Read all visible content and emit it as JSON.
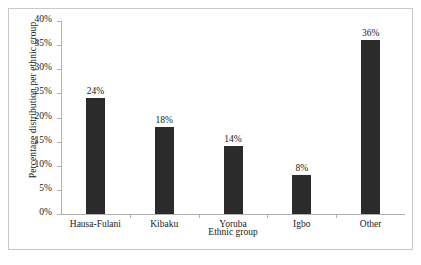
{
  "chart_data": {
    "type": "bar",
    "title": "",
    "categories": [
      "Hausa-Fulani",
      "Kibaku",
      "Yoruba",
      "Igbo",
      "Other"
    ],
    "values": [
      24,
      18,
      14,
      8,
      36
    ],
    "value_labels": [
      "24%",
      "18%",
      "14%",
      "8%",
      "36%"
    ],
    "xlabel": "Ethnic group",
    "ylabel": "Percentage distribution per ethnic group",
    "ylim": [
      0,
      40
    ],
    "ytick_values": [
      0,
      5,
      10,
      15,
      20,
      25,
      30,
      35,
      40
    ],
    "ytick_labels": [
      "0%",
      "5%",
      "10%",
      "15%",
      "20%",
      "25%",
      "30%",
      "35%",
      "40%"
    ],
    "grid": false,
    "legend": false,
    "bar_color": "#2b2b2b",
    "axis_color": "#b0b0b0",
    "border_color": "#c8c8c8",
    "background_color": "#ffffff"
  }
}
